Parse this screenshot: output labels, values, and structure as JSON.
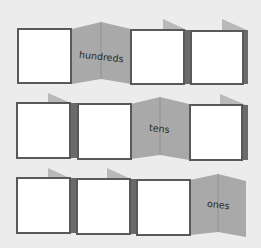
{
  "diagram": {
    "colors": {
      "background": "#ececec",
      "box_fill": "#ffffff",
      "box_border": "#595959",
      "fold_panel": "#a9a9a9",
      "fold_line": "#8c8c8c",
      "tab": "#b9b9b9",
      "side_strip": "#6a6a6a",
      "label_text": "#2a2a2a"
    },
    "rows": [
      {
        "label": "hundreds",
        "panel_count": 4,
        "folded_panel_index": 1
      },
      {
        "label": "tens",
        "panel_count": 4,
        "folded_panel_index": 2
      },
      {
        "label": "ones",
        "panel_count": 4,
        "folded_panel_index": 3
      }
    ]
  }
}
